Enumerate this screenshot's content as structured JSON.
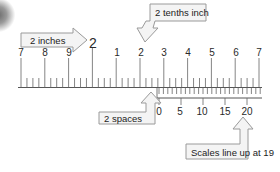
{
  "diagram": {
    "colors": {
      "ticks": "#555555",
      "callout_border": "#9a9a9a",
      "callout_fill": "#f4f4f4",
      "text": "#222222"
    },
    "main_scale": {
      "labels": [
        {
          "text": "7",
          "x": 21
        },
        {
          "text": "8",
          "x": 45
        },
        {
          "text": "9",
          "x": 69
        },
        {
          "text": "1",
          "x": 117
        },
        {
          "text": "2",
          "x": 141
        },
        {
          "text": "3",
          "x": 164
        },
        {
          "text": "4",
          "x": 188
        },
        {
          "text": "5",
          "x": 212
        },
        {
          "text": "6",
          "x": 236
        },
        {
          "text": "7",
          "x": 259
        }
      ],
      "inch_label": {
        "text": "2",
        "x": 93
      }
    },
    "vernier_scale": {
      "labels": [
        {
          "text": "0",
          "x": 159
        },
        {
          "text": "5",
          "x": 180
        },
        {
          "text": "10",
          "x": 202
        },
        {
          "text": "15",
          "x": 225
        },
        {
          "text": "20",
          "x": 247
        }
      ]
    },
    "callouts": {
      "inches": "2 inches",
      "tenths": "2 tenths inch",
      "spaces": "2 spaces",
      "lineup": "Scales line up at 19"
    }
  }
}
